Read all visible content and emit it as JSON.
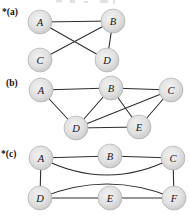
{
  "figure": {
    "background": "#ffffff",
    "edge_color": "#2f2f2f",
    "edge_width": 1.1,
    "graph_label_color": "#111111",
    "node": {
      "radius": 12,
      "fill_inner": "#f1f1f1",
      "fill_mid": "#e2e2e2",
      "fill_outer": "#c7c7c7",
      "stroke": "#a6a6a6",
      "label_color": "#141414"
    },
    "graphs": [
      {
        "id": "a",
        "label": "*(a)",
        "label_x": 2,
        "label_y": 15,
        "nodes": [
          {
            "id": "A",
            "x": 40,
            "y": 22
          },
          {
            "id": "B",
            "x": 113,
            "y": 21
          },
          {
            "id": "C",
            "x": 40,
            "y": 60
          },
          {
            "id": "D",
            "x": 107,
            "y": 60
          }
        ],
        "edges": [
          {
            "from": "A",
            "to": "B"
          },
          {
            "from": "A",
            "to": "D"
          },
          {
            "from": "C",
            "to": "B"
          },
          {
            "from": "B",
            "to": "D"
          }
        ]
      },
      {
        "id": "b",
        "label": "(b)",
        "label_x": 6,
        "label_y": 86,
        "nodes": [
          {
            "id": "A",
            "x": 41,
            "y": 90
          },
          {
            "id": "B",
            "x": 111,
            "y": 88
          },
          {
            "id": "C",
            "x": 171,
            "y": 90
          },
          {
            "id": "D",
            "x": 76,
            "y": 128
          },
          {
            "id": "E",
            "x": 139,
            "y": 127
          }
        ],
        "edges": [
          {
            "from": "A",
            "to": "B"
          },
          {
            "from": "B",
            "to": "C"
          },
          {
            "from": "A",
            "to": "D"
          },
          {
            "from": "B",
            "to": "D"
          },
          {
            "from": "B",
            "to": "E"
          },
          {
            "from": "D",
            "to": "E"
          },
          {
            "from": "D",
            "to": "C"
          },
          {
            "from": "C",
            "to": "E"
          }
        ]
      },
      {
        "id": "c",
        "label": "*(c)",
        "label_x": 1,
        "label_y": 157,
        "nodes": [
          {
            "id": "A",
            "x": 41,
            "y": 158
          },
          {
            "id": "B",
            "x": 110,
            "y": 156
          },
          {
            "id": "C",
            "x": 173,
            "y": 158
          },
          {
            "id": "D",
            "x": 40,
            "y": 198
          },
          {
            "id": "E",
            "x": 110,
            "y": 198
          },
          {
            "id": "F",
            "x": 174,
            "y": 198
          }
        ],
        "edges": [
          {
            "from": "A",
            "to": "B"
          },
          {
            "from": "B",
            "to": "C"
          },
          {
            "from": "A",
            "to": "D"
          },
          {
            "from": "C",
            "to": "F"
          },
          {
            "from": "D",
            "to": "E"
          },
          {
            "from": "E",
            "to": "F"
          },
          {
            "from": "A",
            "to": "C",
            "cx": 107,
            "cy": 192
          },
          {
            "from": "D",
            "to": "F",
            "cx": 107,
            "cy": 170
          }
        ]
      }
    ]
  }
}
